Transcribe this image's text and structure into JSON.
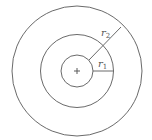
{
  "diagram": {
    "center_symbol": "+",
    "circles": [
      {
        "name": "inner"
      },
      {
        "name": "middle"
      },
      {
        "name": "outer"
      }
    ],
    "labels": {
      "r1": {
        "base": "r",
        "subscript": "1"
      },
      "r2": {
        "base": "r",
        "subscript": "2"
      }
    },
    "colors": {
      "stroke": "#6a6a6a",
      "background": "#ffffff"
    }
  }
}
